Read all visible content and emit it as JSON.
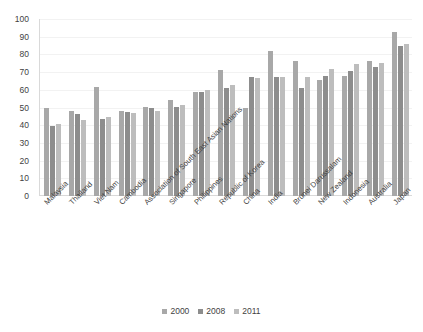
{
  "chart": {
    "title": "",
    "type": "bar"
  },
  "legend": {
    "position": "bottom",
    "entries": [
      {
        "label": "2000",
        "color": "#a8a8a8"
      },
      {
        "label": "2008",
        "color": "#8d8d8d"
      },
      {
        "label": "2011",
        "color": "#bdbdbd"
      }
    ]
  },
  "y_axis": {
    "ticks": [
      "0",
      "10",
      "20",
      "30",
      "40",
      "50",
      "60",
      "70",
      "80",
      "90",
      "100"
    ],
    "min": 0,
    "max": 100,
    "step": 10,
    "label": ""
  },
  "chart_data": {
    "type": "bar",
    "title": "",
    "xlabel": "",
    "ylabel": "",
    "ylim": [
      0,
      100
    ],
    "ytick_step": 10,
    "grid": true,
    "legend_position": "bottom",
    "categories": [
      "Malaysia",
      "Thailand",
      "Viet Nam",
      "Cambodia",
      "Association of South East Asian Nations",
      "Singapore",
      "Philippines",
      "Republic of Korea",
      "China",
      "India",
      "Brunei Darussalam",
      "New Zealand",
      "Indonesia",
      "Australia",
      "Japan"
    ],
    "series": [
      {
        "name": "2000",
        "color": "#a8a8a8",
        "values": [
          49.5,
          48.0,
          61.5,
          48.0,
          50.5,
          54.5,
          58.5,
          71.0,
          49.5,
          82.0,
          76.0,
          65.5,
          68.0,
          76.5,
          92.5
        ]
      },
      {
        "name": "2008",
        "color": "#8d8d8d",
        "values": [
          39.5,
          46.5,
          43.5,
          47.5,
          49.5,
          50.5,
          58.5,
          61.0,
          67.0,
          67.0,
          61.0,
          68.0,
          70.5,
          73.0,
          85.0
        ]
      },
      {
        "name": "2011",
        "color": "#bdbdbd",
        "values": [
          40.5,
          43.0,
          44.5,
          47.0,
          48.0,
          51.5,
          60.0,
          62.5,
          66.5,
          67.5,
          67.5,
          71.5,
          74.5,
          75.0,
          86.0
        ]
      }
    ]
  }
}
